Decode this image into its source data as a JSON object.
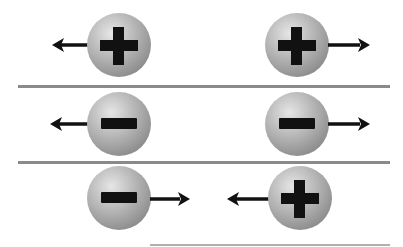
{
  "figure": {
    "rows": [
      {
        "description": "Like charges repel",
        "left": {
          "charge": "+",
          "arrow": "left"
        },
        "right": {
          "charge": "+",
          "arrow": "right"
        }
      },
      {
        "description": "Like charges repel",
        "left": {
          "charge": "-",
          "arrow": "left"
        },
        "right": {
          "charge": "-",
          "arrow": "right"
        }
      },
      {
        "description": "Opposite charges attract",
        "left": {
          "charge": "-",
          "arrow": "right"
        },
        "right": {
          "charge": "+",
          "arrow": "left"
        }
      }
    ],
    "colors": {
      "sphere": "#a8a8a8",
      "symbol": "#111111",
      "arrow": "#111111",
      "divider": "#8a8a8a"
    }
  }
}
